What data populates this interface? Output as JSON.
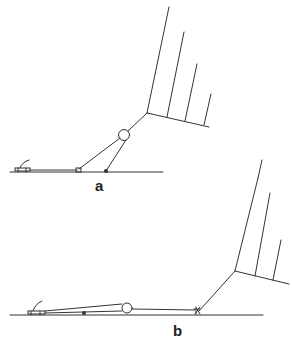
{
  "figure": {
    "panels": [
      {
        "id": "a",
        "label": "a",
        "description": "Structure raised at an angle; strut from ground dot to circular joint"
      },
      {
        "id": "b",
        "label": "b",
        "description": "Structure lowered nearly flat along ground"
      }
    ],
    "colors": {
      "line": "#333333",
      "background": "#ffffff",
      "text": "#222222"
    }
  }
}
